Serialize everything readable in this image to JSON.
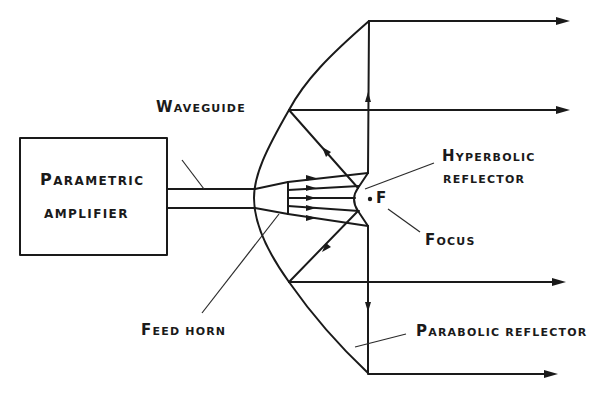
{
  "diagram": {
    "components": {
      "amplifier": {
        "line1_cap": "P",
        "line1_rest": "ARAMETRIC",
        "line2": "AMPLIFIER"
      },
      "waveguide": {
        "cap": "W",
        "rest": "AVEGUIDE"
      },
      "hyperbolic_reflector": {
        "line1_cap": "H",
        "line1_rest": "YPERBOLIC",
        "line2": "REFLECTOR"
      },
      "focus": {
        "point_label": "F",
        "cap": "F",
        "rest": "OCUS"
      },
      "feed_horn": {
        "cap": "F",
        "rest": "EED HORN"
      },
      "parabolic_reflector": {
        "cap": "P",
        "rest": "ARABOLIC REFLECTOR"
      }
    },
    "colors": {
      "ink": "#1a1a1a",
      "background": "#ffffff"
    },
    "output_rays_y": [
      21,
      110,
      282,
      374
    ]
  }
}
